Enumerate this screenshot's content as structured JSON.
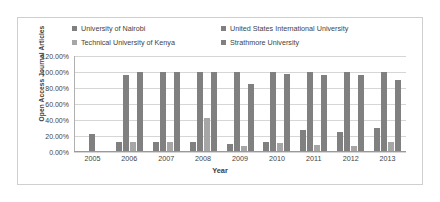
{
  "chart_data": {
    "type": "bar",
    "title": "",
    "xlabel": "Year",
    "ylabel": "Open Access Journal Articles",
    "categories": [
      "2005",
      "2006",
      "2007",
      "2008",
      "2009",
      "2010",
      "2011",
      "2012",
      "2013"
    ],
    "ylim": [
      0,
      120
    ],
    "ytick_labels": [
      "0.00%",
      "20.00%",
      "40.00%",
      "60.00%",
      "80.00%",
      "100.00%",
      "120.00%"
    ],
    "ytick_values": [
      0,
      20,
      40,
      60,
      80,
      100,
      120
    ],
    "grid": true,
    "legend_position": "top",
    "value_suffix": "%",
    "series": [
      {
        "name": "University of Nairobi",
        "color": "#808080",
        "values": [
          22,
          12,
          12,
          12,
          10,
          13,
          27,
          25,
          30
        ]
      },
      {
        "name": "United States International University",
        "color": "#808080",
        "values": [
          null,
          96,
          100,
          100,
          100,
          100,
          100,
          100,
          100
        ]
      },
      {
        "name": "Technical University of Kenya",
        "color": "#a6a6a6",
        "values": [
          null,
          13,
          13,
          42,
          8,
          11,
          9,
          8,
          12
        ]
      },
      {
        "name": "Strathmore University",
        "color": "#808080",
        "values": [
          null,
          100,
          100,
          100,
          85,
          98,
          96,
          96,
          90
        ]
      }
    ]
  },
  "legend": {
    "items": [
      {
        "label": "University of Nairobi"
      },
      {
        "label": "United States International University"
      },
      {
        "label": "Technical University of Kenya"
      },
      {
        "label": "Strathmore University"
      }
    ]
  }
}
